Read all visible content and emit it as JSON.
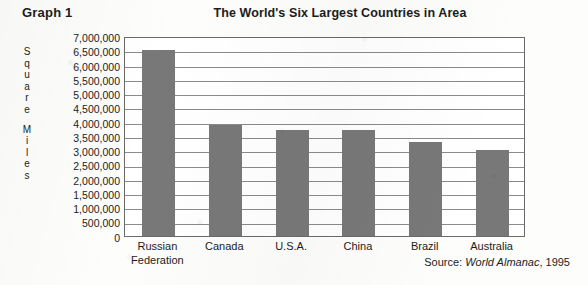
{
  "graph_label": "Graph 1",
  "source_prefix": "Source: ",
  "source_italic": "World Almanac",
  "source_suffix": ", 1995",
  "y_axis_title_lines": [
    "Square",
    "Miles"
  ],
  "chart_data": {
    "type": "bar",
    "title": "The World's Six Largest Countries in Area",
    "xlabel": "",
    "ylabel": "Square Miles",
    "categories": [
      "Russian Federation",
      "Canada",
      "U.S.A.",
      "China",
      "Brazil",
      "Australia"
    ],
    "category_lines": [
      [
        "Russian",
        "Federation"
      ],
      [
        "Canada"
      ],
      [
        "U.S.A."
      ],
      [
        "China"
      ],
      [
        "Brazil"
      ],
      [
        "Australia"
      ]
    ],
    "values": [
      6500000,
      3900000,
      3700000,
      3700000,
      3300000,
      3000000
    ],
    "ylim": [
      0,
      7000000
    ],
    "ytick_step": 500000,
    "yticks": [
      "7,000,000",
      "6,500,000",
      "6,000,000",
      "5,500,000",
      "5,000,000",
      "4,500,000",
      "4,000,000",
      "3,500,000",
      "3,000,000",
      "2,500,000",
      "2,000,000",
      "1,500,000",
      "1,000,000",
      "500,000",
      "0"
    ],
    "grid": true,
    "legend": false,
    "bar_color": "#787878",
    "plot_border_color": "#6a6a6a",
    "gridline_color": "#8a8a8a"
  }
}
